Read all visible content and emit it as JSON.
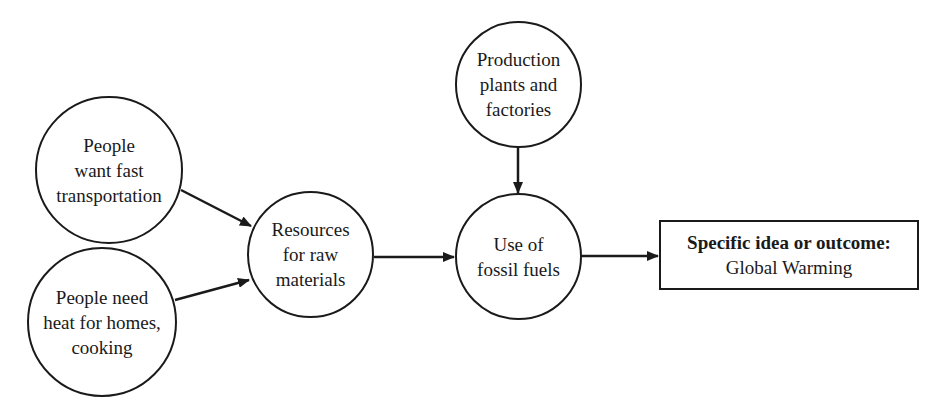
{
  "diagram": {
    "type": "concept-map",
    "nodes": [
      {
        "id": "transport",
        "shape": "circle",
        "lines": [
          "People",
          "want fast",
          "transportation"
        ]
      },
      {
        "id": "heat",
        "shape": "circle",
        "lines": [
          "People need",
          "heat for homes,",
          "cooking"
        ]
      },
      {
        "id": "resources",
        "shape": "circle",
        "lines": [
          "Resources",
          "for raw",
          "materials"
        ]
      },
      {
        "id": "production",
        "shape": "circle",
        "lines": [
          "Production",
          "plants and",
          "factories"
        ]
      },
      {
        "id": "fossil",
        "shape": "circle",
        "lines": [
          "Use of",
          "fossil fuels"
        ]
      },
      {
        "id": "outcome",
        "shape": "rectangle",
        "heading": "Specific idea or outcome:",
        "text": "Global Warming"
      }
    ],
    "edges": [
      {
        "from": "transport",
        "to": "resources"
      },
      {
        "from": "heat",
        "to": "resources"
      },
      {
        "from": "resources",
        "to": "fossil"
      },
      {
        "from": "production",
        "to": "fossil"
      },
      {
        "from": "fossil",
        "to": "outcome"
      }
    ],
    "colors": {
      "stroke": "#1a1a1a",
      "background": "#ffffff"
    }
  }
}
